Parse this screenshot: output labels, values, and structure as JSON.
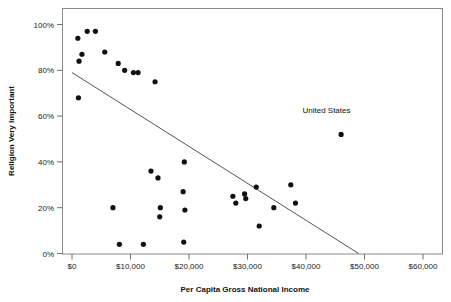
{
  "chart_data": {
    "type": "scatter",
    "title": "",
    "xlabel": "Per Capita Gross National Income",
    "ylabel": "Religion Very Important",
    "xlim": [
      -4000,
      64000
    ],
    "ylim": [
      -5,
      105
    ],
    "grid": false,
    "legend": null,
    "xtick_labels": [
      "$0",
      "$10,000",
      "$20,000",
      "$30,000",
      "$40,000",
      "$50,000",
      "$60,000"
    ],
    "xtick_values": [
      0,
      10000,
      20000,
      30000,
      40000,
      50000,
      60000
    ],
    "ytick_labels": [
      "0%",
      "20%",
      "40%",
      "60%",
      "80%",
      "100%"
    ],
    "ytick_values": [
      0,
      20,
      40,
      60,
      80,
      100
    ],
    "series": [
      {
        "name": "Countries",
        "x": [
          1000,
          2600,
          4000,
          1700,
          1200,
          5600,
          7900,
          9000,
          11300,
          10500,
          14200,
          1100,
          7000,
          8100,
          12200,
          13500,
          14700,
          15000,
          15100,
          19200,
          19000,
          19300,
          19100,
          27500,
          28000,
          29500,
          29700,
          31500,
          32000,
          34500,
          37400,
          38200,
          46000
        ],
        "y": [
          94,
          97,
          97,
          87,
          84,
          88,
          83,
          80,
          79,
          79,
          75,
          68,
          20,
          4,
          4,
          36,
          33,
          16,
          20,
          40,
          27,
          19,
          5,
          25,
          22,
          26,
          24,
          29,
          12,
          20,
          30,
          22,
          52
        ]
      }
    ],
    "fit_line": {
      "x_start": 0,
      "y_start": 79,
      "x_end": 49000,
      "y_end": 0
    },
    "annotations": [
      {
        "text": "United States",
        "x": 43500,
        "y": 61.5,
        "point_x": 46000,
        "point_y": 52
      }
    ]
  }
}
